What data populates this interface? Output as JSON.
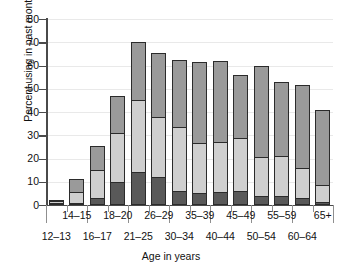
{
  "chart_data": {
    "type": "bar",
    "subtype": "stacked-bar",
    "title": "",
    "xlabel": "Age in years",
    "ylabel": "Percent using in past month",
    "ylim": [
      0,
      80
    ],
    "yticks": [
      0,
      10,
      20,
      30,
      40,
      50,
      60,
      70,
      80
    ],
    "grid": true,
    "legend": "none",
    "categories": [
      "12–13",
      "14–15",
      "16–17",
      "18–20",
      "21–25",
      "26–29",
      "30–34",
      "35–39",
      "40–44",
      "45–49",
      "50–54",
      "55–59",
      "60–64",
      "65+"
    ],
    "series": [
      {
        "name": "bottom-segment",
        "color": "#595959",
        "values": [
          0.5,
          1.0,
          3.0,
          10.0,
          14.0,
          12.0,
          6.0,
          5.0,
          5.5,
          6.0,
          4.0,
          4.0,
          3.0,
          1.5
        ]
      },
      {
        "name": "middle-segment",
        "color": "#cfcfcf",
        "values": [
          1.0,
          4.5,
          12.0,
          21.0,
          31.0,
          26.0,
          27.5,
          21.5,
          21.5,
          23.0,
          16.5,
          17.0,
          13.0,
          7.0
        ]
      },
      {
        "name": "top-segment",
        "color": "#9a9a9a",
        "values": [
          0.5,
          5.5,
          10.5,
          16.0,
          25.0,
          27.5,
          29.0,
          35.0,
          35.0,
          27.0,
          39.5,
          32.0,
          35.5,
          32.5
        ]
      }
    ],
    "totals": [
      2.0,
      11.0,
      25.5,
      47.0,
      70.0,
      65.5,
      62.5,
      61.5,
      62.0,
      56.0,
      60.0,
      53.0,
      51.5,
      41.0
    ],
    "cumulative_boundaries": [
      [
        0.5,
        1.5,
        2.0
      ],
      [
        1.0,
        5.5,
        11.0
      ],
      [
        3.0,
        15.0,
        25.5
      ],
      [
        10.0,
        31.0,
        47.0
      ],
      [
        14.0,
        45.0,
        70.0
      ],
      [
        12.0,
        38.0,
        65.5
      ],
      [
        6.0,
        33.5,
        62.5
      ],
      [
        5.0,
        26.5,
        61.5
      ],
      [
        5.5,
        27.0,
        62.0
      ],
      [
        6.0,
        29.0,
        56.0
      ],
      [
        4.0,
        20.5,
        60.0
      ],
      [
        4.0,
        21.0,
        53.0
      ],
      [
        3.0,
        16.0,
        51.5
      ],
      [
        1.5,
        8.5,
        41.0
      ]
    ],
    "colors": {
      "bottom": "#595959",
      "middle": "#cfcfcf",
      "top": "#9a9a9a",
      "outline": "#2b2b2b",
      "axis": "#4a4a4a",
      "grid": "#e9e9e9",
      "background": "#ffffff"
    }
  }
}
